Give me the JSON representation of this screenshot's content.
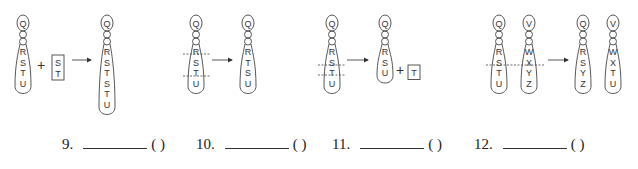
{
  "questions": [
    {
      "number": "9.",
      "paren": "(  )",
      "before": [
        {
          "genes": [
            "Q",
            "R",
            "S",
            "T",
            "U"
          ]
        }
      ],
      "added_segment": [
        "S",
        "T"
      ],
      "after": [
        {
          "genes": [
            "Q",
            "R",
            "S",
            "T",
            "S",
            "T",
            "U"
          ]
        }
      ]
    },
    {
      "number": "10.",
      "paren": "(  )",
      "before": [
        {
          "genes": [
            "Q",
            "R",
            "S",
            "T",
            "U"
          ]
        }
      ],
      "after": [
        {
          "genes": [
            "Q",
            "R",
            "T",
            "S",
            "U"
          ]
        }
      ]
    },
    {
      "number": "11.",
      "paren": "(  )",
      "before": [
        {
          "genes": [
            "Q",
            "R",
            "S",
            "T",
            "U"
          ]
        }
      ],
      "after": [
        {
          "genes": [
            "Q",
            "R",
            "S",
            "U"
          ]
        }
      ],
      "removed_segment": [
        "T"
      ]
    },
    {
      "number": "12.",
      "paren": "(  )",
      "before": [
        {
          "genes": [
            "Q",
            "R",
            "S",
            "T",
            "U"
          ]
        },
        {
          "genes": [
            "V",
            "W",
            "X",
            "Y",
            "Z"
          ]
        }
      ],
      "after": [
        {
          "genes": [
            "Q",
            "R",
            "S",
            "Y",
            "Z"
          ]
        },
        {
          "genes": [
            "V",
            "W",
            "X",
            "T",
            "U"
          ]
        }
      ]
    }
  ],
  "symbols": {
    "plus": "+",
    "arrow": "arrow-right"
  },
  "colors": {
    "stroke": "#444444",
    "text": "#333333"
  }
}
